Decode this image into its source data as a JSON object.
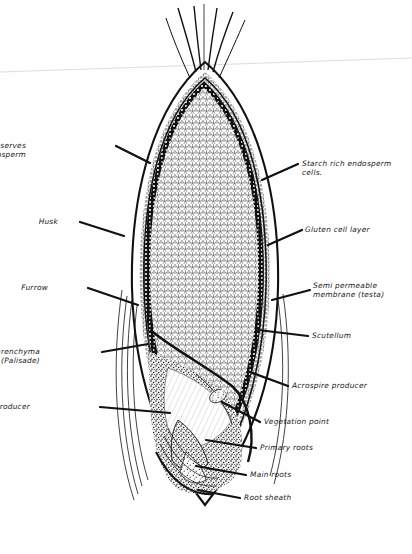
{
  "figure": {
    "type": "botanical-cross-section-diagram",
    "background_color": "#fefefe",
    "ink_color": "#111111",
    "scan_artifact": "faint diagonal scan line across upper page"
  },
  "labels_left": [
    {
      "id": "protein-reserves",
      "line1": "Protein  reserves",
      "line2": "for endosperm",
      "text_x": 26,
      "text_y": 148,
      "leader": "M116,146 L150,163"
    },
    {
      "id": "husk",
      "line1": "Husk",
      "line2": "",
      "text_x": 58,
      "text_y": 224,
      "leader": "M80,222 L124,236"
    },
    {
      "id": "furrow",
      "line1": "Furrow",
      "line2": "",
      "text_x": 48,
      "text_y": 290,
      "leader": "M88,288 L138,305"
    },
    {
      "id": "parenchyma",
      "line1": "Parenchyma",
      "line2": "(Palisade)",
      "text_x": 40,
      "text_y": 354,
      "leader": "M102,352 L148,344"
    },
    {
      "id": "stem-producer",
      "line1": "Stem producer",
      "line2": "",
      "text_x": 30,
      "text_y": 409,
      "leader": "M100,407 L170,413"
    }
  ],
  "labels_right": [
    {
      "id": "starch-rich-endosperm",
      "line1": "Starch rich endosperm",
      "line2": "cells.",
      "text_x": 302,
      "text_y": 166,
      "leader": "M298,164 L262,180"
    },
    {
      "id": "gluten-cell-layer",
      "line1": "Gluten cell layer",
      "line2": "",
      "text_x": 305,
      "text_y": 232,
      "leader": "M302,230 L268,245"
    },
    {
      "id": "semi-permeable-membrane",
      "line1": "Semi permeable",
      "line2": "membrane (testa)",
      "text_x": 313,
      "text_y": 288,
      "leader": "M310,290 L272,300"
    },
    {
      "id": "scutellum",
      "line1": "Scutellum",
      "line2": "",
      "text_x": 312,
      "text_y": 338,
      "leader": "M308,336 L258,330"
    },
    {
      "id": "acrospire-producer",
      "line1": "Acrospire producer",
      "line2": "",
      "text_x": 292,
      "text_y": 388,
      "leader": "M288,386 L250,372"
    },
    {
      "id": "vegetation-point",
      "line1": "Vegetation point",
      "line2": "",
      "text_x": 264,
      "text_y": 424,
      "leader": "M260,422 L222,402"
    },
    {
      "id": "primary-roots",
      "line1": "Primary roots",
      "line2": "",
      "text_x": 260,
      "text_y": 450,
      "leader": "M256,448 L206,440"
    },
    {
      "id": "main-roots",
      "line1": "Main roots",
      "line2": "",
      "text_x": 250,
      "text_y": 477,
      "leader": "M246,475 L196,466"
    },
    {
      "id": "root-sheath",
      "line1": "Root sheath",
      "line2": "",
      "text_x": 244,
      "text_y": 500,
      "leader": "M240,498 L198,490"
    }
  ]
}
